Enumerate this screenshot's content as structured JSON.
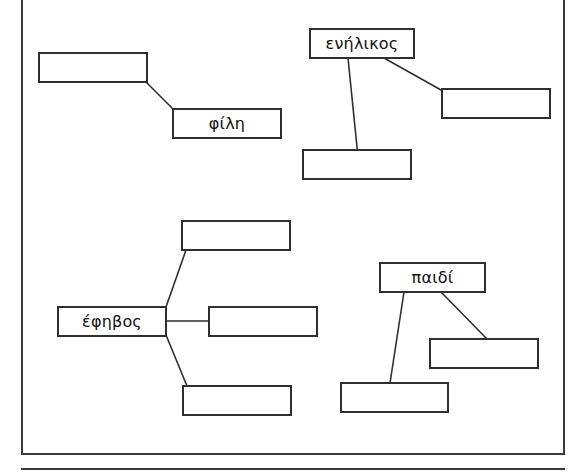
{
  "worksheet": {
    "title": "Greek vocabulary word-association worksheet",
    "description": "Four word-web clusters with one labelled head word each and blank boxes to be filled in",
    "frame_color": "#3a3a3a",
    "box_border_color": "#2f2f2f",
    "text_color": "#111111",
    "background": "#ffffff"
  },
  "clusters": [
    {
      "id": "cluster-fili",
      "head_label": "",
      "nodes": [
        {
          "id": "fili-blank-top",
          "label": "",
          "filled": false
        },
        {
          "id": "fili-word",
          "label": "φίλη",
          "filled": true
        }
      ]
    },
    {
      "id": "cluster-enilikos",
      "head_label": "ενήλικος",
      "nodes": [
        {
          "id": "enilikos-word",
          "label": "ενήλικος",
          "filled": true
        },
        {
          "id": "enilikos-blank-right",
          "label": "",
          "filled": false
        },
        {
          "id": "enilikos-blank-bottom",
          "label": "",
          "filled": false
        }
      ]
    },
    {
      "id": "cluster-efivos",
      "head_label": "έφηβος",
      "nodes": [
        {
          "id": "efivos-word",
          "label": "έφηβος",
          "filled": true
        },
        {
          "id": "efivos-blank-top",
          "label": "",
          "filled": false
        },
        {
          "id": "efivos-blank-middle",
          "label": "",
          "filled": false
        },
        {
          "id": "efivos-blank-bottom",
          "label": "",
          "filled": false
        }
      ]
    },
    {
      "id": "cluster-paidi",
      "head_label": "παιδί",
      "nodes": [
        {
          "id": "paidi-word",
          "label": "παιδί",
          "filled": true
        },
        {
          "id": "paidi-blank-right",
          "label": "",
          "filled": false
        },
        {
          "id": "paidi-blank-left",
          "label": "",
          "filled": false
        }
      ]
    }
  ],
  "boxes": {
    "fili_blank_top": {
      "label": ""
    },
    "fili_word": {
      "label": "φίλη"
    },
    "enilikos_word": {
      "label": "ενήλικος"
    },
    "enilikos_blank_right": {
      "label": ""
    },
    "enilikos_blank_bottom": {
      "label": ""
    },
    "efivos_word": {
      "label": "έφηβος"
    },
    "efivos_blank_top": {
      "label": ""
    },
    "efivos_blank_middle": {
      "label": ""
    },
    "efivos_blank_bottom": {
      "label": ""
    },
    "paidi_word": {
      "label": "παιδί"
    },
    "paidi_blank_right": {
      "label": ""
    },
    "paidi_blank_left": {
      "label": ""
    }
  }
}
